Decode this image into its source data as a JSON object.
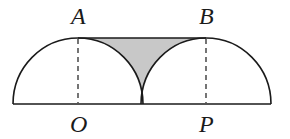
{
  "diagram": {
    "type": "geometry",
    "labels": {
      "A": "A",
      "B": "B",
      "O": "O",
      "P": "P"
    },
    "points": {
      "A": [
        78,
        38
      ],
      "B": [
        206,
        38
      ],
      "O": [
        78,
        104
      ],
      "P": [
        206,
        104
      ],
      "M": [
        142,
        104
      ]
    },
    "radius": 64,
    "baseline": {
      "x1": 13,
      "x2": 271,
      "y": 104
    },
    "colors": {
      "stroke": "#1a1a1a",
      "shade": "#c8c8c8",
      "background": "#ffffff"
    }
  }
}
